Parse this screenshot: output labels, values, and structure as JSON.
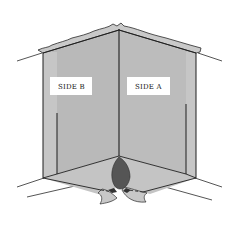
{
  "diagram": {
    "type": "corner-burn-pattern-illustration",
    "labels": {
      "side_b": "SIDE B",
      "side_a": "SIDE A"
    },
    "colors": {
      "background": "#ffffff",
      "wall_fill": "#b9b9b9",
      "wall_edge_fill": "#c8c8c8",
      "floor_fill": "#c4c4c4",
      "line": "#1f1f1f",
      "burn_pattern": "#555555",
      "label_box": "#ffffff"
    }
  }
}
